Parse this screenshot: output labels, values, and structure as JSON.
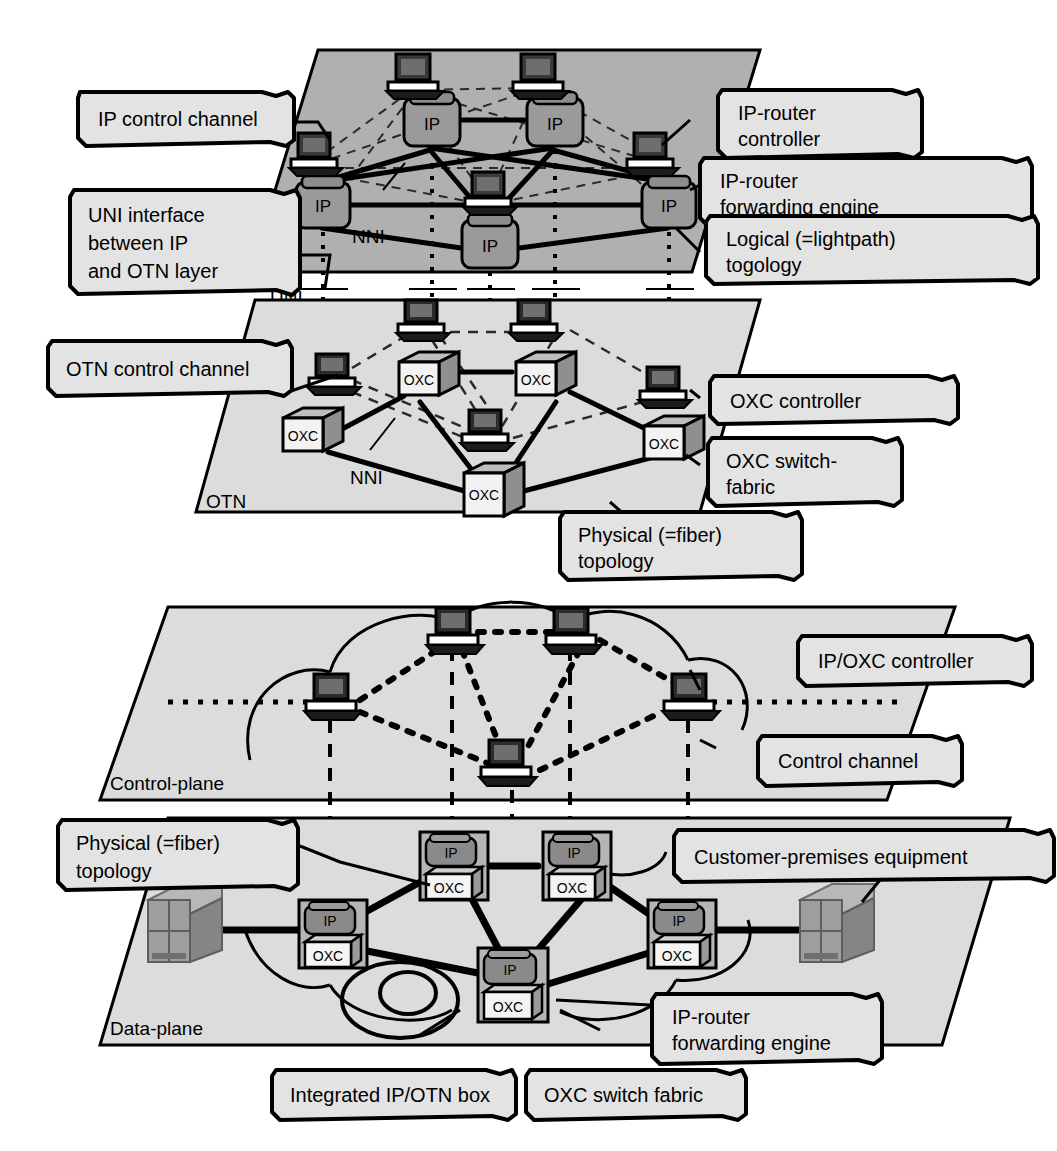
{
  "figure": {
    "planes": [
      {
        "id": "ip-plane",
        "label": "IP",
        "fill": "#b0b0b0"
      },
      {
        "id": "otn-plane",
        "label": "OTN",
        "fill": "#dcdcdc"
      },
      {
        "id": "control-plane",
        "label": "Control-plane",
        "fill": "#dcdcdc"
      },
      {
        "id": "data-plane",
        "label": "Data-plane",
        "fill": "#dcdcdc"
      }
    ],
    "interface_labels": {
      "uni": "UNI",
      "nni_ip": "NNI",
      "nni_otn": "NNI"
    }
  },
  "callouts": {
    "ip_control_channel": "IP control channel",
    "uni_interface": "UNI interface\nbetween IP\nand OTN layer",
    "otn_control_channel": "OTN control channel",
    "ip_router_controller": "IP-router\ncontroller",
    "ip_router_forwarding_engine": "IP-router\nforwarding engine",
    "logical_topology": "Logical (=lightpath)\ntogology",
    "oxc_controller": "OXC controller",
    "oxc_switch_fabric_hyphen": "OXC switch-\nfabric",
    "physical_topology_otn": "Physical (=fiber)\ntopology",
    "ip_oxc_controller": "IP/OXC controller",
    "control_channel": "Control channel",
    "physical_topology_data": "Physical (=fiber)\ntopology",
    "customer_premises_equipment": "Customer-premises equipment",
    "integrated_box": "Integrated IP/OTN box",
    "oxc_switch_fabric": "OXC switch fabric",
    "ip_router_forwarding_engine_2": "IP-router\nforwarding engine"
  },
  "nodes": {
    "ip_routers": [
      {
        "id": "ip-r1",
        "label": "IP",
        "x": 430,
        "y": 123
      },
      {
        "id": "ip-r2",
        "label": "IP",
        "x": 553,
        "y": 123
      },
      {
        "id": "ip-r3",
        "label": "IP",
        "x": 322,
        "y": 205
      },
      {
        "id": "ip-r4",
        "label": "IP",
        "x": 668,
        "y": 205
      },
      {
        "id": "ip-r5",
        "label": "IP",
        "x": 489,
        "y": 243
      }
    ],
    "ip_controllers": [
      {
        "id": "ip-c1",
        "x": 412,
        "y": 73
      },
      {
        "id": "ip-c2",
        "x": 537,
        "y": 73
      },
      {
        "id": "ip-c3",
        "x": 313,
        "y": 150
      },
      {
        "id": "ip-c4",
        "x": 648,
        "y": 150
      },
      {
        "id": "ip-c5",
        "x": 487,
        "y": 190
      }
    ],
    "oxc_nodes": [
      {
        "id": "oxc-1",
        "label": "OXC",
        "x": 425,
        "y": 380
      },
      {
        "id": "oxc-2",
        "label": "OXC",
        "x": 542,
        "y": 380
      },
      {
        "id": "oxc-3",
        "label": "OXC",
        "x": 308,
        "y": 435
      },
      {
        "id": "oxc-4",
        "label": "OXC",
        "x": 668,
        "y": 443
      },
      {
        "id": "oxc-5",
        "label": "OXC",
        "x": 490,
        "y": 490
      }
    ],
    "oxc_controllers": [
      {
        "id": "oxc-c1",
        "x": 420,
        "y": 318
      },
      {
        "id": "oxc-c2",
        "x": 533,
        "y": 318
      },
      {
        "id": "oxc-c3",
        "x": 331,
        "y": 372
      },
      {
        "id": "oxc-c4",
        "x": 662,
        "y": 385
      },
      {
        "id": "oxc-c5",
        "x": 484,
        "y": 428
      }
    ],
    "control_plane_controllers": [
      {
        "id": "cp-1",
        "x": 452,
        "y": 630
      },
      {
        "id": "cp-2",
        "x": 570,
        "y": 630
      },
      {
        "id": "cp-3",
        "x": 330,
        "y": 697
      },
      {
        "id": "cp-4",
        "x": 688,
        "y": 697
      },
      {
        "id": "cp-5",
        "x": 505,
        "y": 763
      }
    ],
    "integrated_boxes": [
      {
        "id": "ib-1",
        "ip_label": "IP",
        "oxc_label": "OXC",
        "x": 447,
        "y": 866
      },
      {
        "id": "ib-2",
        "ip_label": "IP",
        "oxc_label": "OXC",
        "x": 570,
        "y": 866
      },
      {
        "id": "ib-3",
        "ip_label": "IP",
        "oxc_label": "OXC",
        "x": 330,
        "y": 935
      },
      {
        "id": "ib-4",
        "ip_label": "IP",
        "oxc_label": "OXC",
        "x": 679,
        "y": 935
      },
      {
        "id": "ib-5",
        "ip_label": "IP",
        "oxc_label": "OXC",
        "x": 512,
        "y": 985
      }
    ],
    "cpe": [
      {
        "id": "cpe-left",
        "x": 180,
        "y": 925
      },
      {
        "id": "cpe-right",
        "x": 849,
        "y": 925
      }
    ]
  },
  "legend": {
    "line_styles": [
      {
        "name": "solid-thick",
        "meaning": "Physical (=fiber) topology / NNI link"
      },
      {
        "name": "dashed-thin",
        "meaning": "Logical (=lightpath) topology / control channel"
      },
      {
        "name": "dotted-vertical",
        "meaning": "UNI interface between IP and OTN layer"
      }
    ]
  },
  "colors": {
    "ip_plane": "#b0b0b0",
    "otn_plane": "#dcdcdc",
    "node_fill_ip": "#9a9a9a",
    "node_fill_oxc": "#efefef",
    "outline": "#000000",
    "callout_fill": "#e3e3e3",
    "cpe_fill": "#9e9e9e"
  }
}
